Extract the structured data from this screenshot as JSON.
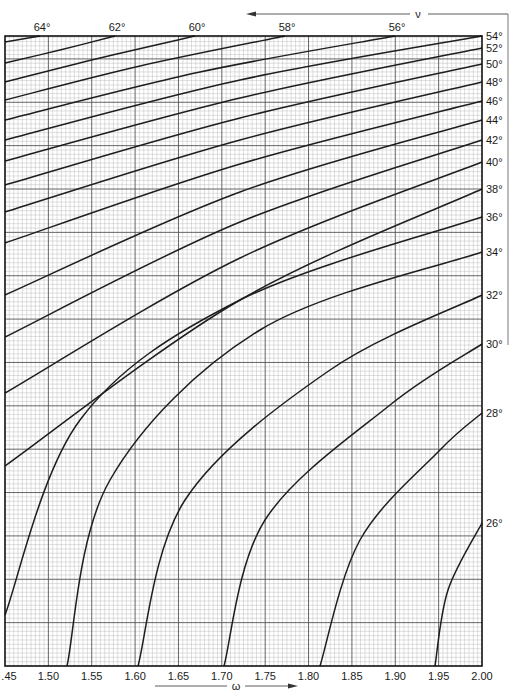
{
  "chart_data": {
    "type": "line",
    "title": "",
    "xlabel": "ω",
    "ylabel": "",
    "top_axis_label": "ν",
    "xlim": [
      1.45,
      2.0
    ],
    "x_ticks": [
      1.45,
      1.5,
      1.55,
      1.6,
      1.65,
      1.7,
      1.75,
      1.8,
      1.85,
      1.9,
      1.95,
      2.0
    ],
    "x_tick_labels": [
      ".45",
      "1.50",
      "1.55",
      "1.60",
      "1.65",
      "1.70",
      "1.75",
      "1.80",
      "1.85",
      "1.90",
      "1.95",
      "2.00"
    ],
    "grid": true,
    "curve_family_label": "ν (degrees)",
    "top_labels": [
      "64°",
      "62°",
      "60°",
      "58°",
      "56°"
    ],
    "right_labels": [
      "54°",
      "52°",
      "50°",
      "48°",
      "46°",
      "44°",
      "42°",
      "40°",
      "38°",
      "36°",
      "34°",
      "32°",
      "30°",
      "28°",
      "26°"
    ],
    "series": [
      {
        "name": "64°",
        "exit": "top",
        "points_px": [
          [
            5,
            42
          ],
          [
            40,
            36
          ]
        ]
      },
      {
        "name": "62°",
        "exit": "top",
        "points_px": [
          [
            5,
            63
          ],
          [
            60,
            50
          ],
          [
            115,
            36
          ]
        ]
      },
      {
        "name": "60°",
        "exit": "top",
        "points_px": [
          [
            5,
            82
          ],
          [
            100,
            58
          ],
          [
            195,
            36
          ]
        ]
      },
      {
        "name": "58°",
        "exit": "top",
        "points_px": [
          [
            5,
            100
          ],
          [
            140,
            66
          ],
          [
            285,
            36
          ]
        ]
      },
      {
        "name": "56°",
        "exit": "top",
        "points_px": [
          [
            5,
            120
          ],
          [
            200,
            72
          ],
          [
            395,
            36
          ]
        ]
      },
      {
        "name": "54°",
        "exit": "right",
        "points_px": [
          [
            5,
            140
          ],
          [
            240,
            80
          ],
          [
            482,
            36
          ]
        ]
      },
      {
        "name": "52°",
        "exit": "right",
        "points_px": [
          [
            5,
            161
          ],
          [
            240,
            98
          ],
          [
            482,
            48
          ]
        ]
      },
      {
        "name": "50°",
        "exit": "right",
        "points_px": [
          [
            5,
            185
          ],
          [
            240,
            118
          ],
          [
            482,
            64
          ]
        ]
      },
      {
        "name": "48°",
        "exit": "right",
        "points_px": [
          [
            5,
            212
          ],
          [
            240,
            140
          ],
          [
            482,
            82
          ]
        ]
      },
      {
        "name": "46°",
        "exit": "right",
        "points_px": [
          [
            5,
            243
          ],
          [
            240,
            164
          ],
          [
            482,
            101
          ]
        ]
      },
      {
        "name": "44°",
        "exit": "right",
        "points_px": [
          [
            5,
            295
          ],
          [
            240,
            192
          ],
          [
            482,
            120
          ]
        ]
      },
      {
        "name": "42°",
        "exit": "right",
        "points_px": [
          [
            5,
            337
          ],
          [
            240,
            222
          ],
          [
            482,
            140
          ]
        ]
      },
      {
        "name": "40°",
        "exit": "right",
        "points_px": [
          [
            5,
            393
          ],
          [
            240,
            258
          ],
          [
            482,
            162
          ]
        ]
      },
      {
        "name": "38°",
        "exit": "right",
        "points_px": [
          [
            5,
            466
          ],
          [
            240,
            300
          ],
          [
            482,
            189
          ]
        ]
      },
      {
        "name": "36°",
        "exit": "right",
        "points_px": [
          [
            5,
            615
          ],
          [
            80,
            420
          ],
          [
            240,
            300
          ],
          [
            482,
            217
          ]
        ]
      },
      {
        "name": "34°",
        "exit": "right",
        "points_px": [
          [
            67,
            666
          ],
          [
            110,
            480
          ],
          [
            260,
            330
          ],
          [
            482,
            252
          ]
        ]
      },
      {
        "name": "32°",
        "exit": "right",
        "points_px": [
          [
            138,
            666
          ],
          [
            185,
            500
          ],
          [
            330,
            370
          ],
          [
            482,
            295
          ]
        ]
      },
      {
        "name": "30°",
        "exit": "right",
        "points_px": [
          [
            224,
            666
          ],
          [
            265,
            520
          ],
          [
            390,
            405
          ],
          [
            482,
            344
          ]
        ]
      },
      {
        "name": "28°",
        "exit": "right",
        "points_px": [
          [
            320,
            666
          ],
          [
            360,
            540
          ],
          [
            440,
            450
          ],
          [
            482,
            413
          ]
        ]
      },
      {
        "name": "26°",
        "exit": "right",
        "points_px": [
          [
            435,
            666
          ],
          [
            448,
            590
          ],
          [
            482,
            523
          ]
        ]
      }
    ],
    "bottom_intercepts": [
      {
        "name": "34°",
        "omega": 1.52
      },
      {
        "name": "32°",
        "omega": 1.605
      },
      {
        "name": "30°",
        "omega": 1.7
      },
      {
        "name": "28°",
        "omega": 1.81
      },
      {
        "name": "26°",
        "omega": 1.945
      }
    ],
    "colors": {
      "curve": "#1e1e1e",
      "grid_minor": "#b8b8b8",
      "grid_major": "#555555",
      "frame": "#111111"
    }
  }
}
